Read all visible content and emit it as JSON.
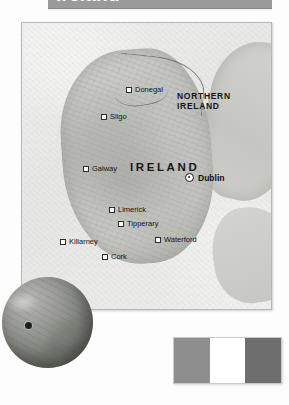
{
  "page": {
    "title": "Ireland",
    "background_color": "#fdfdfd"
  },
  "title_banner": {
    "label": "Ireland",
    "background_color": "#9a9a9a",
    "text_color": "#ffffff"
  },
  "map": {
    "name": "ireland-map",
    "frame_color": "#b6b6b6",
    "regions": [
      {
        "id": "northern-ireland",
        "label": "NORTHERN\nIRELAND"
      },
      {
        "id": "ireland",
        "label": "IRELAND"
      }
    ],
    "capital": {
      "name": "Dublin",
      "marker": "capital-circle-dot-icon"
    },
    "cities": [
      {
        "name": "Donegal",
        "marker": "city-square-icon"
      },
      {
        "name": "Sligo",
        "marker": "city-square-icon"
      },
      {
        "name": "Galway",
        "marker": "city-square-icon"
      },
      {
        "name": "Limerick",
        "marker": "city-square-icon"
      },
      {
        "name": "Tipperary",
        "marker": "city-square-icon"
      },
      {
        "name": "Killarney",
        "marker": "city-square-icon"
      },
      {
        "name": "Cork",
        "marker": "city-square-icon"
      },
      {
        "name": "Waterford",
        "marker": "city-square-icon"
      }
    ]
  },
  "globe_inset": {
    "name": "globe-locator",
    "marker_label": "location-marker-icon"
  },
  "flag": {
    "name": "ireland-flag",
    "bands": [
      {
        "id": "hoist",
        "color": "#8e8e8e"
      },
      {
        "id": "middle",
        "color": "#ffffff"
      },
      {
        "id": "fly",
        "color": "#6e6e6e"
      }
    ]
  }
}
